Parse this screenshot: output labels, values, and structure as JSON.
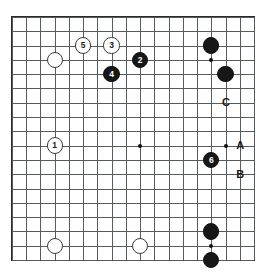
{
  "diagram": {
    "type": "go-board-diagram",
    "board": {
      "columns": 18,
      "rows": 18,
      "background_color": "#ffffff",
      "line_color": "#555a5e",
      "border_color": "#2a2a2a"
    },
    "colors": {
      "black_stone": "#171717",
      "white_stone": "#ffffff",
      "stone_outline": "#3a3a3a",
      "label_text": "#1a1a1a"
    },
    "star_points": [
      {
        "name": "star-point-center",
        "col": 9,
        "row": 9
      },
      {
        "name": "star-point-upper-right",
        "col": 14,
        "row": 3
      },
      {
        "name": "star-point-right",
        "col": 15,
        "row": 9
      },
      {
        "name": "star-point-lower-right",
        "col": 14,
        "row": 16
      }
    ],
    "stones": [
      {
        "name": "white-stone-plain-upper-left",
        "color": "white",
        "label": "",
        "col": 3,
        "row": 3
      },
      {
        "name": "white-stone-move-5",
        "color": "white",
        "label": "5",
        "col": 5,
        "row": 2
      },
      {
        "name": "white-stone-move-3",
        "color": "white",
        "label": "3",
        "col": 7,
        "row": 2
      },
      {
        "name": "black-stone-move-2",
        "color": "black",
        "label": "2",
        "col": 9,
        "row": 3
      },
      {
        "name": "black-stone-move-4",
        "color": "black",
        "label": "4",
        "col": 7,
        "row": 4
      },
      {
        "name": "black-stone-plain-upper-right-a",
        "color": "black",
        "label": "",
        "col": 14,
        "row": 2
      },
      {
        "name": "black-stone-plain-upper-right-b",
        "color": "black",
        "label": "",
        "col": 15,
        "row": 4
      },
      {
        "name": "white-stone-move-1",
        "color": "white",
        "label": "1",
        "col": 3,
        "row": 9
      },
      {
        "name": "black-stone-move-6",
        "color": "black",
        "label": "6",
        "col": 14,
        "row": 10
      },
      {
        "name": "white-stone-plain-lower-left",
        "color": "white",
        "label": "",
        "col": 3,
        "row": 16
      },
      {
        "name": "white-stone-plain-lower-center",
        "color": "white",
        "label": "",
        "col": 9,
        "row": 16
      },
      {
        "name": "black-stone-plain-lower-right-a",
        "color": "black",
        "label": "",
        "col": 14,
        "row": 15
      },
      {
        "name": "black-stone-plain-lower-right-b",
        "color": "black",
        "label": "",
        "col": 14,
        "row": 17
      }
    ],
    "point_labels": [
      {
        "name": "point-label-c",
        "text": "C",
        "col": 15,
        "row": 6
      },
      {
        "name": "point-label-a",
        "text": "A",
        "col": 16,
        "row": 9
      },
      {
        "name": "point-label-b",
        "text": "B",
        "col": 16,
        "row": 11
      }
    ]
  }
}
